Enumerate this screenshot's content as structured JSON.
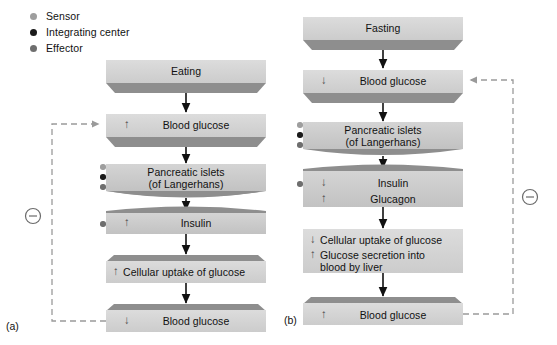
{
  "figure": {
    "background_color": "#ffffff",
    "box_face_color": "#c9c9c9",
    "box_bevel_color": "#8f8f8f",
    "line_color": "#111111",
    "dashed_color": "#9a9a9a"
  },
  "legend": {
    "items": [
      {
        "label": "Sensor",
        "color": "#9e9e9e",
        "key": "sensor"
      },
      {
        "label": "Integrating center",
        "color": "#1a1a1a",
        "key": "integrating-center"
      },
      {
        "label": "Effector",
        "color": "#6e6e6e",
        "key": "effector"
      }
    ]
  },
  "panels": [
    {
      "id": "a",
      "label": "(a)",
      "feedback": {
        "symbol": "⊖",
        "meaning": "negative feedback",
        "side": "left",
        "from_step": "blood-glucose-down",
        "to_step": "blood-glucose-up"
      },
      "steps": [
        {
          "key": "eating",
          "text": "Eating",
          "change": "",
          "markers": []
        },
        {
          "key": "blood-glucose-up",
          "text": "Blood glucose",
          "change": "↑",
          "markers": []
        },
        {
          "key": "pancreatic-islets",
          "text_line1": "Pancreatic islets",
          "text_line2": "(of Langerhans)",
          "change": "",
          "markers": [
            "sensor",
            "integrating-center",
            "effector"
          ]
        },
        {
          "key": "insulin",
          "text": "Insulin",
          "change": "↑",
          "markers": [
            "effector"
          ]
        },
        {
          "key": "cellular-uptake",
          "text": "Cellular uptake of glucose",
          "change": "↑",
          "markers": []
        },
        {
          "key": "blood-glucose-down",
          "text": "Blood glucose",
          "change": "↓",
          "markers": []
        }
      ]
    },
    {
      "id": "b",
      "label": "(b)",
      "feedback": {
        "symbol": "⊖",
        "meaning": "negative feedback",
        "side": "right",
        "from_step": "blood-glucose-up-b",
        "to_step": "blood-glucose-down-b"
      },
      "steps": [
        {
          "key": "fasting",
          "text": "Fasting",
          "change": "",
          "markers": []
        },
        {
          "key": "blood-glucose-down-b",
          "text": "Blood glucose",
          "change": "↓",
          "markers": []
        },
        {
          "key": "pancreatic-islets-b",
          "text_line1": "Pancreatic islets",
          "text_line2": "(of Langerhans)",
          "change": "",
          "markers": [
            "sensor",
            "integrating-center",
            "effector"
          ]
        },
        {
          "key": "insulin-glucagon",
          "text_line1": "Insulin",
          "text_line2": "Glucagon",
          "change_line1": "↓",
          "change_line2": "↑",
          "markers": [
            "effector"
          ]
        },
        {
          "key": "uptake-secretion",
          "text_line1": "Cellular uptake of glucose",
          "text_line2": "Glucose secretion into",
          "text_line3": "blood by liver",
          "change_line1": "↓",
          "change_line2": "↑",
          "markers": []
        },
        {
          "key": "blood-glucose-up-b",
          "text": "Blood glucose",
          "change": "↑",
          "markers": []
        }
      ]
    }
  ]
}
